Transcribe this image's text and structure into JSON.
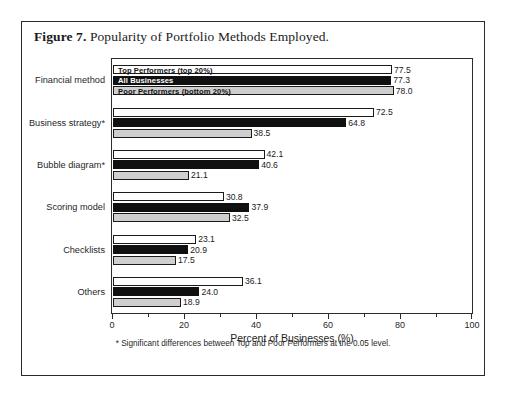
{
  "figure": {
    "label": "Figure 7.",
    "caption": " Popularity of Portfolio Methods Employed."
  },
  "footnote": "* Significant differences between Top and Poor Performers at the 0.05 level.",
  "legend": {
    "top_label": "Top Performers (top 20%)",
    "all_label": "All Businesses",
    "poor_label": "Poor Performers (bottom 20%)"
  },
  "colors": {
    "top": "#ffffff",
    "all": "#101010",
    "poor": "#cfcfcf",
    "outline": "#1a1a1a",
    "frame": "#2b2b2b"
  },
  "chart_data": {
    "type": "bar",
    "orientation": "horizontal",
    "title": "Popularity of Portfolio Methods Employed.",
    "xlabel": "Percent of Businesses (%)",
    "ylabel": "",
    "xlim": [
      0,
      100
    ],
    "xticks": [
      0,
      20,
      40,
      60,
      80,
      100
    ],
    "xtick_labels": [
      "0",
      "20",
      "40",
      "60",
      "80",
      "100"
    ],
    "minor_tick_step": 10,
    "grid": false,
    "legend_position": "inside-first-group",
    "categories": [
      "Financial method",
      "Business strategy*",
      "Bubble diagram*",
      "Scoring model",
      "Checklists",
      "Others"
    ],
    "series": [
      {
        "name": "Top Performers (top 20%)",
        "color": "#ffffff",
        "values": [
          77.5,
          72.5,
          42.1,
          30.8,
          23.1,
          36.1
        ],
        "labels": [
          "77.5",
          "72.5",
          "42.1",
          "30.8",
          "23.1",
          "36.1"
        ]
      },
      {
        "name": "All Businesses",
        "color": "#101010",
        "values": [
          77.3,
          64.8,
          40.6,
          37.9,
          20.9,
          24.0
        ],
        "labels": [
          "77.3",
          "64.8",
          "40.6",
          "37.9",
          "20.9",
          "24.0"
        ]
      },
      {
        "name": "Poor Performers (bottom 20%)",
        "color": "#cfcfcf",
        "values": [
          78.0,
          38.5,
          21.1,
          32.5,
          17.5,
          18.9
        ],
        "labels": [
          "78.0",
          "38.5",
          "21.1",
          "32.5",
          "17.5",
          "18.9"
        ]
      }
    ],
    "annotations": [
      "* Significant differences between Top and Poor Performers at the 0.05 level."
    ]
  }
}
